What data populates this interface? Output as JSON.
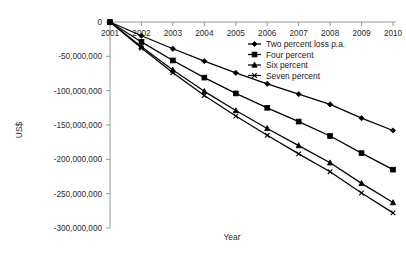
{
  "chart_data": {
    "type": "line",
    "title": "",
    "xlabel": "Year",
    "ylabel": "US$",
    "x": [
      2001,
      2002,
      2003,
      2004,
      2005,
      2006,
      2007,
      2008,
      2009,
      2010
    ],
    "xtick_labels": [
      "2001",
      "2002",
      "2003",
      "2004",
      "2005",
      "2006",
      "2007",
      "2008",
      "2009",
      "2010"
    ],
    "ytick_labels": [
      "0",
      "-50,000,000",
      "-100,000,000",
      "-150,000,000",
      "-200,000,000",
      "-250,000,000",
      "-300,000,000"
    ],
    "ytick_values": [
      0,
      -50000000,
      -100000000,
      -150000000,
      -200000000,
      -250000000,
      -300000000
    ],
    "ylim": [
      -300000000,
      0
    ],
    "xlim": [
      2001,
      2010
    ],
    "grid": false,
    "legend_position": "top-right",
    "series": [
      {
        "name": "Two percent loss p.a.",
        "marker": "diamond",
        "color": "#000000",
        "values": [
          0,
          -20000000,
          -39000000,
          -57000000,
          -74000000,
          -90000000,
          -105000000,
          -120000000,
          -140000000,
          -158000000
        ]
      },
      {
        "name": "Four percent",
        "marker": "square",
        "color": "#000000",
        "values": [
          0,
          -29000000,
          -56000000,
          -81000000,
          -104000000,
          -125000000,
          -145000000,
          -166000000,
          -191000000,
          -215000000
        ]
      },
      {
        "name": "Six percent",
        "marker": "triangle",
        "color": "#000000",
        "values": [
          0,
          -36000000,
          -70000000,
          -101000000,
          -129000000,
          -155000000,
          -180000000,
          -205000000,
          -235000000,
          -263000000
        ]
      },
      {
        "name": "Seven percent",
        "marker": "cross",
        "color": "#000000",
        "values": [
          0,
          -38000000,
          -74000000,
          -107000000,
          -137000000,
          -165000000,
          -192000000,
          -218000000,
          -249000000,
          -278000000
        ]
      }
    ]
  },
  "legend": {
    "items": [
      {
        "label": "Two percent loss p.a."
      },
      {
        "label": "Four percent"
      },
      {
        "label": "Six percent"
      },
      {
        "label": "Seven percent"
      }
    ]
  }
}
